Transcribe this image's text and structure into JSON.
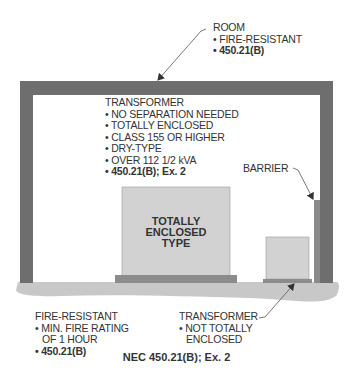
{
  "diagram": {
    "colors": {
      "wall": "#6e6e6e",
      "floor": "#c8c8c8",
      "transformer_body": "#d2d2d2",
      "transformer_base": "#8c8c8c",
      "text": "#333333"
    },
    "room_label": {
      "title": "ROOM",
      "items": [
        "• FIRE-RESISTANT",
        "• 450.21(B)"
      ]
    },
    "transformer_label": {
      "title": "TRANSFORMER",
      "items": [
        "• NO SEPARATION NEEDED",
        "• TOTALLY ENCLOSED",
        "• CLASS 155 OR HIGHER",
        "• DRY-TYPE",
        "• OVER 112 1/2 kVA",
        "• 450.21(B); Ex. 2"
      ]
    },
    "transformer_box_text": [
      "TOTALLY",
      "ENCLOSED",
      "TYPE"
    ],
    "barrier_label": "BARRIER",
    "floor_label": {
      "title": "FIRE-RESISTANT",
      "items": [
        "• MIN. FIRE RATING",
        "OF 1 HOUR",
        "• 450.21(B)"
      ]
    },
    "small_transformer_label": {
      "title": "TRANSFORMER",
      "items": [
        "• NOT TOTALLY",
        "ENCLOSED"
      ]
    },
    "caption": "NEC 450.21(B); Ex. 2"
  }
}
